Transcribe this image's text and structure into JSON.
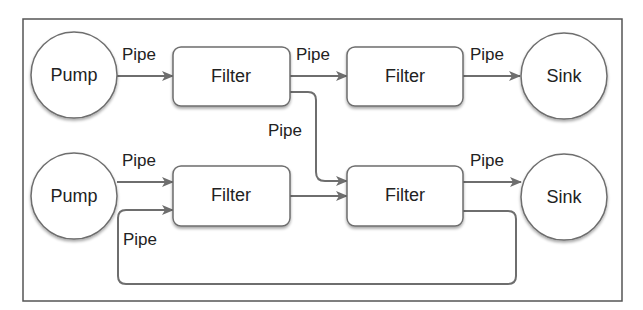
{
  "diagram": {
    "nodes": {
      "pump1": {
        "label": "Pump"
      },
      "pump2": {
        "label": "Pump"
      },
      "filter1": {
        "label": "Filter"
      },
      "filter2": {
        "label": "Filter"
      },
      "filter3": {
        "label": "Filter"
      },
      "filter4": {
        "label": "Filter"
      },
      "sink1": {
        "label": "Sink"
      },
      "sink2": {
        "label": "Sink"
      }
    },
    "edges": {
      "pump1_filter1": {
        "label": "Pipe"
      },
      "filter1_filter2": {
        "label": "Pipe"
      },
      "filter2_sink1": {
        "label": "Pipe"
      },
      "filter1_filter4": {
        "label": "Pipe"
      },
      "pump2_filter3": {
        "label": "Pipe"
      },
      "filter4_filter3_loop": {
        "label": "Pipe"
      },
      "filter4_sink2": {
        "label": "Pipe"
      },
      "filter3_filter4": {
        "label": ""
      }
    },
    "colors": {
      "stroke": "#6e6e6e",
      "frame": "#555555",
      "text": "#222222",
      "fill": "#ffffff"
    }
  }
}
